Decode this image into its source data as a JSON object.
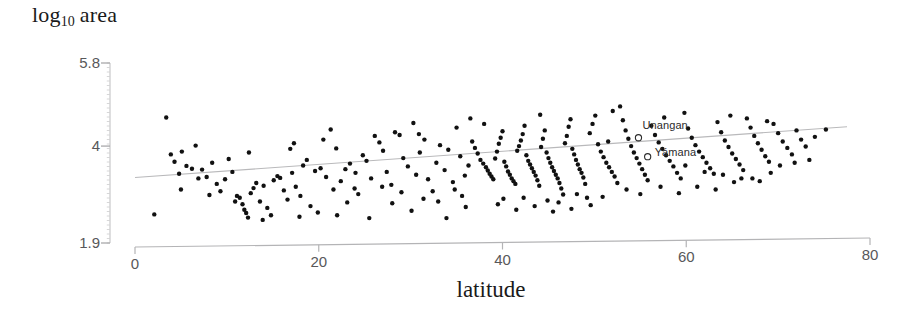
{
  "chart_data": {
    "type": "scatter",
    "title": "",
    "xlabel": "latitude",
    "ylabel_main": "log",
    "ylabel_sub": "10",
    "ylabel_tail": "area",
    "xlim": [
      0,
      80
    ],
    "ylim": [
      1.9,
      5.8
    ],
    "grid": false,
    "legend": null,
    "xticks": [
      {
        "value": 0,
        "label": "0"
      },
      {
        "value": 20,
        "label": "20"
      },
      {
        "value": 40,
        "label": "40"
      },
      {
        "value": 60,
        "label": "60"
      },
      {
        "value": 80,
        "label": "80"
      }
    ],
    "yticks": [
      {
        "value": 5.8,
        "label": "5.8"
      },
      {
        "value": 4,
        "label": "4"
      },
      {
        "value": 1.9,
        "label": "1.9"
      }
    ],
    "marker": {
      "shape": "circle",
      "filled": true,
      "color": "#111111",
      "size": 4.4
    },
    "trendline": {
      "type": "linear-fit",
      "color": "#b9b9bb",
      "width": 1.1,
      "x_start": 0,
      "x_end": 77.5,
      "y_start": 3.32,
      "y_end": 4.42
    },
    "annotations": [
      {
        "label": "Unangan",
        "x": 54.8,
        "y": 4.18,
        "marker": "open-circle",
        "label_dx": 4,
        "label_dy": -12
      },
      {
        "label": "Yámana",
        "x": 55.8,
        "y": 3.77,
        "marker": "open-circle",
        "label_dx": 7,
        "label_dy": -4
      }
    ],
    "points": [
      [
        2.1,
        2.52
      ],
      [
        3.4,
        4.62
      ],
      [
        4.3,
        3.66
      ],
      [
        4.8,
        3.4
      ],
      [
        5.1,
        3.88
      ],
      [
        5.6,
        3.57
      ],
      [
        6.2,
        3.51
      ],
      [
        6.6,
        4.01
      ],
      [
        7.3,
        3.49
      ],
      [
        7.8,
        3.33
      ],
      [
        8.4,
        3.64
      ],
      [
        8.9,
        3.18
      ],
      [
        9.3,
        3.02
      ],
      [
        9.8,
        3.28
      ],
      [
        10.2,
        3.72
      ],
      [
        10.6,
        3.44
      ],
      [
        11.1,
        2.92
      ],
      [
        11.4,
        2.88
      ],
      [
        11.7,
        2.74
      ],
      [
        11.9,
        2.62
      ],
      [
        12.1,
        2.55
      ],
      [
        12.3,
        2.45
      ],
      [
        12.6,
        2.98
      ],
      [
        12.9,
        3.09
      ],
      [
        13.2,
        3.2
      ],
      [
        13.6,
        2.8
      ],
      [
        14.0,
        3.14
      ],
      [
        14.4,
        2.66
      ],
      [
        14.8,
        2.5
      ],
      [
        15.1,
        3.26
      ],
      [
        15.5,
        3.35
      ],
      [
        15.8,
        3.31
      ],
      [
        16.2,
        3.04
      ],
      [
        16.6,
        2.84
      ],
      [
        17.1,
        3.42
      ],
      [
        17.5,
        3.12
      ],
      [
        17.9,
        2.47
      ],
      [
        18.3,
        3.58
      ],
      [
        18.7,
        3.7
      ],
      [
        19.1,
        2.7
      ],
      [
        19.6,
        3.46
      ],
      [
        20.2,
        3.52
      ],
      [
        20.8,
        3.33
      ],
      [
        21.3,
        4.36
      ],
      [
        21.9,
        3.95
      ],
      [
        22.4,
        3.24
      ],
      [
        22.9,
        3.5
      ],
      [
        23.4,
        3.62
      ],
      [
        23.9,
        3.08
      ],
      [
        24.3,
        2.96
      ],
      [
        24.8,
        3.8
      ],
      [
        25.2,
        3.68
      ],
      [
        25.7,
        3.3
      ],
      [
        26.1,
        4.22
      ],
      [
        26.6,
        4.08
      ],
      [
        27.0,
        3.9
      ],
      [
        27.4,
        3.44
      ],
      [
        27.9,
        3.16
      ],
      [
        28.3,
        4.3
      ],
      [
        28.8,
        4.24
      ],
      [
        29.2,
        3.74
      ],
      [
        29.7,
        3.56
      ],
      [
        30.1,
        2.6
      ],
      [
        30.6,
        3.38
      ],
      [
        31.0,
        3.86
      ],
      [
        31.5,
        4.14
      ],
      [
        31.9,
        3.28
      ],
      [
        32.4,
        3.02
      ],
      [
        32.8,
        3.64
      ],
      [
        33.2,
        4.02
      ],
      [
        33.7,
        3.48
      ],
      [
        34.1,
        3.92
      ],
      [
        34.6,
        3.22
      ],
      [
        35.0,
        4.4
      ],
      [
        35.4,
        3.78
      ],
      [
        35.9,
        3.36
      ],
      [
        36.3,
        3.58
      ],
      [
        36.7,
        4.1
      ],
      [
        37.0,
        3.96
      ],
      [
        37.3,
        3.84
      ],
      [
        37.6,
        3.7
      ],
      [
        37.9,
        3.62
      ],
      [
        38.2,
        3.54
      ],
      [
        38.4,
        3.47
      ],
      [
        38.6,
        3.4
      ],
      [
        38.8,
        3.34
      ],
      [
        39.0,
        3.28
      ],
      [
        39.2,
        3.73
      ],
      [
        39.4,
        3.88
      ],
      [
        39.6,
        4.05
      ],
      [
        39.8,
        4.18
      ],
      [
        40.0,
        4.32
      ],
      [
        40.2,
        3.66
      ],
      [
        40.4,
        3.56
      ],
      [
        40.6,
        3.45
      ],
      [
        40.8,
        3.38
      ],
      [
        41.0,
        3.3
      ],
      [
        41.2,
        3.24
      ],
      [
        41.4,
        3.18
      ],
      [
        41.6,
        3.9
      ],
      [
        41.8,
        4.0
      ],
      [
        42.0,
        4.12
      ],
      [
        42.2,
        4.26
      ],
      [
        42.4,
        4.44
      ],
      [
        42.6,
        3.8
      ],
      [
        42.8,
        3.68
      ],
      [
        43.0,
        3.6
      ],
      [
        43.2,
        3.52
      ],
      [
        43.4,
        3.44
      ],
      [
        43.6,
        3.36
      ],
      [
        43.8,
        3.26
      ],
      [
        44.0,
        3.14
      ],
      [
        44.2,
        3.98
      ],
      [
        44.4,
        4.16
      ],
      [
        44.6,
        4.34
      ],
      [
        44.8,
        3.86
      ],
      [
        45.0,
        3.74
      ],
      [
        45.2,
        3.64
      ],
      [
        45.4,
        3.54
      ],
      [
        45.6,
        3.46
      ],
      [
        45.8,
        3.38
      ],
      [
        46.0,
        3.3
      ],
      [
        46.2,
        3.2
      ],
      [
        46.4,
        3.08
      ],
      [
        46.6,
        2.95
      ],
      [
        46.8,
        4.06
      ],
      [
        47.0,
        4.22
      ],
      [
        47.2,
        4.42
      ],
      [
        47.4,
        4.58
      ],
      [
        47.6,
        3.94
      ],
      [
        47.8,
        3.82
      ],
      [
        48.0,
        3.7
      ],
      [
        48.2,
        3.6
      ],
      [
        48.4,
        3.5
      ],
      [
        48.6,
        3.42
      ],
      [
        48.8,
        3.32
      ],
      [
        49.0,
        3.18
      ],
      [
        49.2,
        2.88
      ],
      [
        49.5,
        4.28
      ],
      [
        49.8,
        4.48
      ],
      [
        50.1,
        4.66
      ],
      [
        50.4,
        4.04
      ],
      [
        50.7,
        3.88
      ],
      [
        51.0,
        3.76
      ],
      [
        51.3,
        3.64
      ],
      [
        51.6,
        3.54
      ],
      [
        51.9,
        3.44
      ],
      [
        52.2,
        3.34
      ],
      [
        52.5,
        3.2
      ],
      [
        52.8,
        4.86
      ],
      [
        53.1,
        4.56
      ],
      [
        53.4,
        4.34
      ],
      [
        53.7,
        4.16
      ],
      [
        54.0,
        4.0
      ],
      [
        54.3,
        3.86
      ],
      [
        54.6,
        3.74
      ],
      [
        54.9,
        3.62
      ],
      [
        55.2,
        3.5
      ],
      [
        55.5,
        3.38
      ],
      [
        55.8,
        3.26
      ],
      [
        56.2,
        4.44
      ],
      [
        56.6,
        4.24
      ],
      [
        57.0,
        4.08
      ],
      [
        57.4,
        3.94
      ],
      [
        57.8,
        3.8
      ],
      [
        58.2,
        3.68
      ],
      [
        58.6,
        3.56
      ],
      [
        59.0,
        3.42
      ],
      [
        59.4,
        3.3
      ],
      [
        59.8,
        4.72
      ],
      [
        60.2,
        4.38
      ],
      [
        60.6,
        4.18
      ],
      [
        61.0,
        4.02
      ],
      [
        61.4,
        3.88
      ],
      [
        61.8,
        3.76
      ],
      [
        62.2,
        3.64
      ],
      [
        62.6,
        3.52
      ],
      [
        63.0,
        3.4
      ],
      [
        63.4,
        4.52
      ],
      [
        63.8,
        4.3
      ],
      [
        64.2,
        4.12
      ],
      [
        64.6,
        3.98
      ],
      [
        65.0,
        3.84
      ],
      [
        65.4,
        3.72
      ],
      [
        65.8,
        3.6
      ],
      [
        66.2,
        3.48
      ],
      [
        66.6,
        4.6
      ],
      [
        67.0,
        4.4
      ],
      [
        67.4,
        4.22
      ],
      [
        67.8,
        4.06
      ],
      [
        68.2,
        3.92
      ],
      [
        68.6,
        3.78
      ],
      [
        69.0,
        3.66
      ],
      [
        69.5,
        4.48
      ],
      [
        70.0,
        4.28
      ],
      [
        70.5,
        4.1
      ],
      [
        71.0,
        3.96
      ],
      [
        71.5,
        3.82
      ],
      [
        72.0,
        4.34
      ],
      [
        72.5,
        4.14
      ],
      [
        73.0,
        3.99
      ],
      [
        74.0,
        4.2
      ],
      [
        75.2,
        4.36
      ],
      [
        3.9,
        3.82
      ],
      [
        6.9,
        3.3
      ],
      [
        12.4,
        3.86
      ],
      [
        16.9,
        3.94
      ],
      [
        19.9,
        2.56
      ],
      [
        21.6,
        3.06
      ],
      [
        24.0,
        3.42
      ],
      [
        26.9,
        3.12
      ],
      [
        29.0,
        3.0
      ],
      [
        30.9,
        4.26
      ],
      [
        33.0,
        2.8
      ],
      [
        34.8,
        3.06
      ],
      [
        36.0,
        2.68
      ],
      [
        38.0,
        4.48
      ],
      [
        39.5,
        2.74
      ],
      [
        41.5,
        2.62
      ],
      [
        43.5,
        2.7
      ],
      [
        45.5,
        2.58
      ],
      [
        47.5,
        2.64
      ],
      [
        49.6,
        2.72
      ],
      [
        51.5,
        4.1
      ],
      [
        53.5,
        3.06
      ],
      [
        55.0,
        2.96
      ],
      [
        57.2,
        3.12
      ],
      [
        59.2,
        2.98
      ],
      [
        61.2,
        3.12
      ],
      [
        63.2,
        3.06
      ],
      [
        65.2,
        3.22
      ],
      [
        67.2,
        3.3
      ],
      [
        69.2,
        3.42
      ],
      [
        44.9,
        2.82
      ],
      [
        42.3,
        2.88
      ],
      [
        40.1,
        2.86
      ],
      [
        35.6,
        2.92
      ],
      [
        31.4,
        2.86
      ],
      [
        28.0,
        2.76
      ],
      [
        23.1,
        2.78
      ],
      [
        18.0,
        2.92
      ],
      [
        13.9,
        2.4
      ],
      [
        10.9,
        2.8
      ],
      [
        8.1,
        2.94
      ],
      [
        5.0,
        3.06
      ],
      [
        50.9,
        2.9
      ],
      [
        48.1,
        2.96
      ],
      [
        46.1,
        2.78
      ],
      [
        59.9,
        3.58
      ],
      [
        62.0,
        3.44
      ],
      [
        64.0,
        3.38
      ],
      [
        66.0,
        3.3
      ],
      [
        68.0,
        3.24
      ],
      [
        70.2,
        3.58
      ],
      [
        71.8,
        3.64
      ],
      [
        73.4,
        3.7
      ],
      [
        36.5,
        4.6
      ],
      [
        44.1,
        4.68
      ],
      [
        52.0,
        4.76
      ],
      [
        30.3,
        4.5
      ],
      [
        20.5,
        4.14
      ],
      [
        17.3,
        4.06
      ],
      [
        57.6,
        4.62
      ],
      [
        64.8,
        4.66
      ],
      [
        68.8,
        4.54
      ],
      [
        22.0,
        2.5
      ],
      [
        25.5,
        2.44
      ],
      [
        33.9,
        2.44
      ]
    ]
  }
}
